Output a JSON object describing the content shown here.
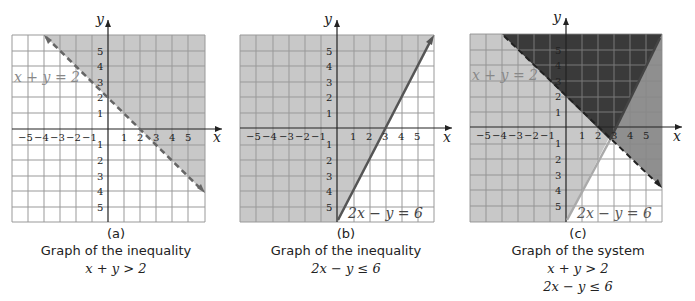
{
  "figure": {
    "panels": [
      {
        "id": "a",
        "letter": "(a)",
        "title": "Graph of the inequality",
        "equations": [
          "x + y > 2"
        ],
        "line_label": "x + y = 2",
        "axis_x": "x",
        "axis_y": "y"
      },
      {
        "id": "b",
        "letter": "(b)",
        "title": "Graph of the inequality",
        "equations": [
          "2x − y ≤ 6"
        ],
        "line_label": "2x − y = 6",
        "axis_x": "x",
        "axis_y": "y"
      },
      {
        "id": "c",
        "letter": "(c)",
        "title": "Graph of the system",
        "equations": [
          "x + y > 2",
          "2x − y ≤ 6"
        ],
        "line_label_1": "x + y = 2",
        "line_label_2": "2x − y = 6",
        "axis_x": "x",
        "axis_y": "y"
      }
    ],
    "ticks": {
      "x": [
        "−5",
        "−4",
        "−3",
        "−2",
        "−1",
        "1",
        "2",
        "3",
        "4",
        "5"
      ],
      "y": [
        "5",
        "4",
        "3",
        "2",
        "1",
        "1",
        "2",
        "3",
        "4",
        "5"
      ]
    },
    "colors": {
      "shade_light": "#c8c8c8",
      "shade_mid": "#8f8f8f",
      "shade_dark": "#3a3a3a",
      "grid": "#8a8a8a",
      "line": "#555555"
    }
  }
}
